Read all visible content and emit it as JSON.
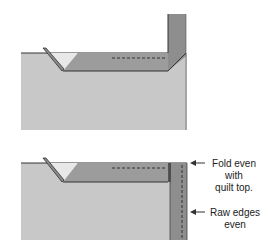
{
  "diagram": {
    "steps": [
      {
        "id": "step-1",
        "description": "Binding folded up at 45-degree angle at corner"
      },
      {
        "id": "step-2",
        "description": "Binding folded down along next edge"
      }
    ],
    "labels": {
      "fold": [
        "Fold even",
        "with",
        "quilt top."
      ],
      "raw": [
        "Raw edges",
        "even"
      ]
    },
    "colors": {
      "quilt": "#c8c8c8",
      "binding": "#9a9a9a",
      "binding_dark": "#8a8a8a",
      "triangle": "#e6e6e6",
      "line": "#333333"
    }
  }
}
